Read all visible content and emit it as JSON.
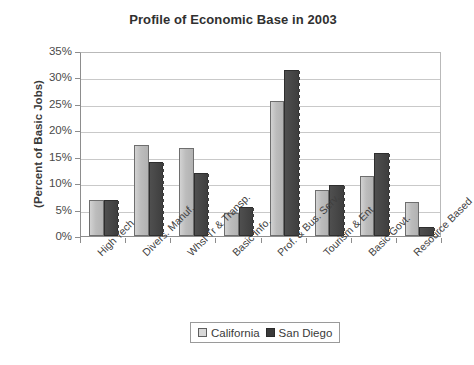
{
  "chart_data": {
    "type": "bar",
    "title": "Profile of Economic Base in 2003",
    "xlabel": "",
    "ylabel": "(Percent of Basic Jobs)",
    "ylim": [
      0,
      35
    ],
    "ytick_labels": [
      "35%",
      "30%",
      "25%",
      "20%",
      "15%",
      "10%",
      "5%",
      "0%"
    ],
    "ytick_values": [
      35,
      30,
      25,
      20,
      15,
      10,
      5,
      0
    ],
    "grid": true,
    "legend_position": "bottom",
    "categories": [
      "High Tech",
      "Divers. Manuf.",
      "Whsl Tr & Transp.",
      "Basic Info.",
      "Prof. & Bus. Serv.",
      "Tourism & Ent",
      "Basic Govt.",
      "Resource Based"
    ],
    "series": [
      {
        "name": "California",
        "color": "#bdbdbd",
        "values": [
          6.8,
          17.2,
          16.6,
          4.3,
          25.6,
          8.8,
          11.3,
          6.4
        ]
      },
      {
        "name": "San Diego",
        "color": "#454545",
        "values": [
          6.8,
          14.0,
          12.0,
          5.4,
          31.5,
          9.6,
          15.8,
          1.7
        ]
      }
    ]
  }
}
